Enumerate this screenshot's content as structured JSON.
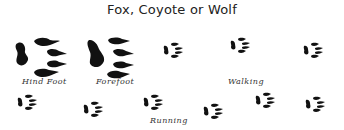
{
  "title": "Fox, Coyote or Wolf",
  "labels": {
    "hind_foot": "Hind Foot",
    "forefoot": "Forefoot",
    "walking": "Walking",
    "running": "Running"
  },
  "colors": {
    "ink": "#111111",
    "background": "#ffffff"
  },
  "prints": {
    "large": [
      {
        "name": "hind-foot-print",
        "x": 14,
        "y": 37,
        "scale": 1.0
      },
      {
        "name": "forefoot-print",
        "x": 86,
        "y": 36,
        "scale": 1.05
      }
    ],
    "walking": [
      {
        "x": 163,
        "y": 42
      },
      {
        "x": 230,
        "y": 37
      },
      {
        "x": 303,
        "y": 42
      }
    ],
    "running": [
      {
        "x": 17,
        "y": 94
      },
      {
        "x": 83,
        "y": 101
      },
      {
        "x": 143,
        "y": 94
      },
      {
        "x": 203,
        "y": 103
      },
      {
        "x": 255,
        "y": 92
      },
      {
        "x": 305,
        "y": 96
      }
    ]
  }
}
